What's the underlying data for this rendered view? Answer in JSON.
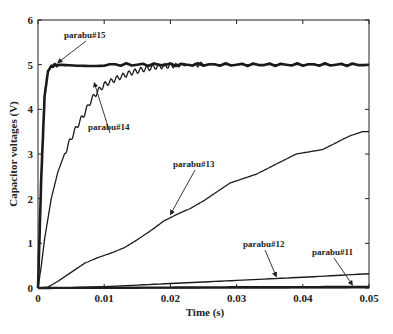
{
  "chart_data": {
    "type": "line",
    "title": "",
    "xlabel": "Time (s)",
    "ylabel": "Capacitor voltages (V)",
    "xlim": [
      0,
      0.05
    ],
    "ylim": [
      0,
      6
    ],
    "xticks": [
      "0",
      "0.01",
      "0.02",
      "0.03",
      "0.04",
      "0.05"
    ],
    "yticks": [
      "0",
      "1",
      "2",
      "3",
      "4",
      "5",
      "6"
    ],
    "grid": false,
    "legend": "none (inline annotations with arrows)",
    "series": [
      {
        "name": "parabu#15",
        "x": [
          0,
          0.0005,
          0.001,
          0.0015,
          0.002,
          0.003,
          0.01,
          0.02,
          0.03,
          0.04,
          0.05
        ],
        "y": [
          0,
          2.5,
          4.3,
          4.85,
          4.97,
          5.0,
          5.0,
          5.0,
          5.0,
          5.0,
          5.0
        ]
      },
      {
        "name": "parabu#14",
        "x": [
          0,
          0.0005,
          0.001,
          0.002,
          0.003,
          0.004,
          0.005,
          0.006,
          0.007,
          0.008,
          0.009,
          0.01,
          0.012,
          0.014,
          0.016,
          0.018,
          0.02,
          0.025,
          0.03,
          0.05
        ],
        "y": [
          0,
          0.5,
          1.1,
          2.0,
          2.6,
          3.0,
          3.35,
          3.65,
          3.9,
          4.2,
          4.4,
          4.55,
          4.7,
          4.82,
          4.9,
          4.96,
          4.98,
          5.0,
          5.0,
          5.0
        ]
      },
      {
        "name": "parabu#13",
        "x": [
          0,
          0.0015,
          0.003,
          0.005,
          0.007,
          0.009,
          0.011,
          0.013,
          0.015,
          0.017,
          0.019,
          0.021,
          0.023,
          0.025,
          0.027,
          0.029,
          0.031,
          0.033,
          0.035,
          0.037,
          0.039,
          0.041,
          0.043,
          0.045,
          0.047,
          0.049,
          0.05
        ],
        "y": [
          0,
          0.02,
          0.15,
          0.35,
          0.55,
          0.68,
          0.78,
          0.9,
          1.08,
          1.28,
          1.5,
          1.65,
          1.78,
          1.95,
          2.15,
          2.35,
          2.45,
          2.55,
          2.7,
          2.85,
          3.0,
          3.05,
          3.1,
          3.25,
          3.4,
          3.5,
          3.5
        ]
      },
      {
        "name": "parabu#12",
        "x": [
          0,
          0.005,
          0.01,
          0.02,
          0.03,
          0.04,
          0.05
        ],
        "y": [
          0,
          0.01,
          0.03,
          0.1,
          0.17,
          0.24,
          0.32
        ]
      },
      {
        "name": "parabu#11",
        "x": [
          0,
          0.01,
          0.02,
          0.03,
          0.04,
          0.05
        ],
        "y": [
          0,
          0.005,
          0.01,
          0.015,
          0.02,
          0.025
        ]
      }
    ],
    "annotations": [
      {
        "text": "parabu#15",
        "target": [
          0.003,
          5.0
        ]
      },
      {
        "text": "parabu#14",
        "target": [
          0.0085,
          4.55
        ]
      },
      {
        "text": "parabu#13",
        "target": [
          0.02,
          1.6
        ]
      },
      {
        "text": "parabu#12",
        "target": [
          0.036,
          0.21
        ]
      },
      {
        "text": "parabu#11",
        "target": [
          0.0475,
          0.02
        ]
      }
    ]
  }
}
